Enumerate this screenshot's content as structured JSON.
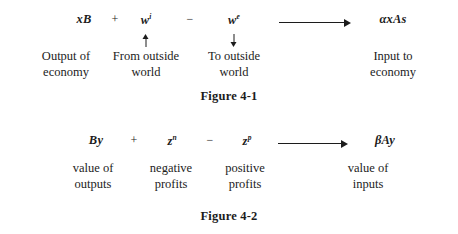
{
  "page": {
    "background_color": "#ffffff",
    "text_color": "#1c1c1c"
  },
  "figures": [
    {
      "id": "figure-4-1",
      "caption": "Figure 4-1",
      "equation": {
        "terms": [
          {
            "base": "xB",
            "sup": "",
            "x": 84
          },
          {
            "base": "w",
            "sup": "i",
            "x": 146
          },
          {
            "base": "w",
            "sup": "e",
            "x": 234
          },
          {
            "base": "αxAs",
            "sup": "",
            "x": 393
          }
        ],
        "operators": [
          {
            "symbol": "+",
            "x": 115
          },
          {
            "symbol": "−",
            "x": 190
          }
        ],
        "arrow": {
          "direction": "right",
          "x": 315,
          "width": 72
        }
      },
      "vertical_arrows": [
        {
          "direction": "up",
          "x": 146
        },
        {
          "direction": "down",
          "x": 234
        }
      ],
      "labels": [
        {
          "line1": "Output of",
          "line2": "economy",
          "x": 66
        },
        {
          "line1": "From outside",
          "line2": "world",
          "x": 146
        },
        {
          "line1": "To outside",
          "line2": "world",
          "x": 234
        },
        {
          "line1": "Input to",
          "line2": "economy",
          "x": 393
        }
      ]
    },
    {
      "id": "figure-4-2",
      "caption": "Figure 4-2",
      "equation": {
        "terms": [
          {
            "base": "By",
            "sup": "",
            "x": 96
          },
          {
            "base": "z",
            "sup": "n",
            "x": 172
          },
          {
            "base": "z",
            "sup": "p",
            "x": 247
          },
          {
            "base": "βAy",
            "sup": "",
            "x": 385
          }
        ],
        "operators": [
          {
            "symbol": "+",
            "x": 134
          },
          {
            "symbol": "−",
            "x": 210
          }
        ],
        "arrow": {
          "direction": "right",
          "x": 313,
          "width": 70
        }
      },
      "vertical_arrows": [],
      "labels": [
        {
          "line1": "value of",
          "line2": "outputs",
          "x": 93
        },
        {
          "line1": "negative",
          "line2": "profits",
          "x": 171
        },
        {
          "line1": "positive",
          "line2": "profits",
          "x": 245
        },
        {
          "line1": "value of",
          "line2": "inputs",
          "x": 368
        }
      ]
    }
  ]
}
